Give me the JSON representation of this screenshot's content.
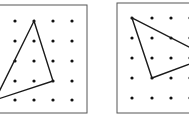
{
  "figure": {
    "panels": [
      {
        "name": "left-geoboard",
        "frame": {
          "x": -10,
          "y": 5,
          "w": 97,
          "h": 108
        },
        "dots_x": [
          15,
          34,
          53,
          72
        ],
        "dots_y": [
          21,
          41,
          61,
          81,
          100
        ],
        "polygon": [
          [
            34,
            21
          ],
          [
            53,
            81
          ],
          [
            -5,
            100
          ]
        ]
      },
      {
        "name": "right-geoboard",
        "frame": {
          "x": 117,
          "y": 3,
          "w": 90,
          "h": 110
        },
        "dots_x": [
          132,
          152,
          171,
          190
        ],
        "dots_y": [
          18,
          38,
          58,
          78,
          98
        ],
        "polygon": [
          [
            132,
            18
          ],
          [
            152,
            78
          ],
          [
            195,
            62
          ],
          [
            195,
            50
          ]
        ]
      }
    ],
    "colors": {
      "line": "#1a1a1a",
      "frame": "#555555",
      "dot": "#111111",
      "background": "#ffffff"
    }
  }
}
